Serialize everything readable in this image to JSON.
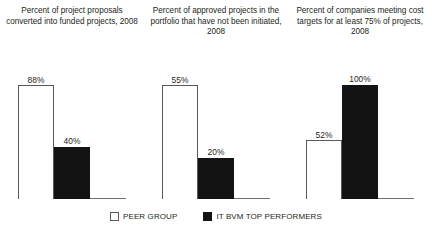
{
  "chart_data": {
    "type": "bar",
    "title": "",
    "legend_position": "bottom-center",
    "grid": false,
    "ylabel": "",
    "xlabel": "",
    "note": "Three independently scaled panels; each panel's tallest bar is normalized to the panel height.",
    "series": [
      {
        "name": "PEER GROUP",
        "color": "#ffffff",
        "values": [
          88,
          55,
          52
        ]
      },
      {
        "name": "IT BVM TOP PERFORMERS",
        "color": "#131313",
        "values": [
          40,
          20,
          100
        ]
      }
    ],
    "categories": [
      "Percent of project proposals converted into funded projects, 2008",
      "Percent of approved projects in the portfolio that have not been initiated, 2008",
      "Percent of companies meeting cost targets for at least 75% of projects, 2008"
    ],
    "panels": [
      {
        "title": "Percent of project proposals converted into funded projects, 2008",
        "bars": [
          {
            "series": "PEER GROUP",
            "value": 88,
            "label": "88%",
            "fill": "white"
          },
          {
            "series": "IT BVM TOP PERFORMERS",
            "value": 40,
            "label": "40%",
            "fill": "black"
          }
        ]
      },
      {
        "title": "Percent of approved projects in the portfolio that have not been initiated, 2008",
        "bars": [
          {
            "series": "PEER GROUP",
            "value": 55,
            "label": "55%",
            "fill": "white"
          },
          {
            "series": "IT BVM TOP PERFORMERS",
            "value": 20,
            "label": "20%",
            "fill": "black"
          }
        ]
      },
      {
        "title": "Percent of companies meeting cost targets for at least 75% of projects, 2008",
        "bars": [
          {
            "series": "PEER GROUP",
            "value": 52,
            "label": "52%",
            "fill": "white"
          },
          {
            "series": "IT BVM TOP PERFORMERS",
            "value": 100,
            "label": "100%",
            "fill": "black"
          }
        ]
      }
    ]
  },
  "legend": {
    "items": [
      {
        "label": "PEER GROUP",
        "fill": "white"
      },
      {
        "label": "IT BVM TOP PERFORMERS",
        "fill": "black"
      }
    ]
  },
  "source": {
    "text": ""
  },
  "colors": {
    "black": "#131313",
    "white": "#ffffff",
    "axis": "#6d6e71",
    "outline": "#58595b",
    "text": "#231f20"
  }
}
